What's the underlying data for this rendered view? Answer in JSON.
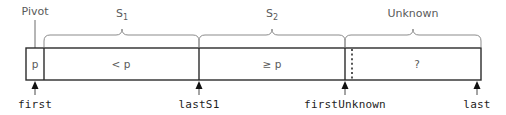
{
  "figure": {
    "width": 506,
    "height": 115,
    "background_color": "#ffffff",
    "line_color": "#2b2b2b",
    "brace_color": "#8b8b8b",
    "label_color": "#5a5a5a",
    "index_color": "#1d1d1d"
  },
  "annotations": {
    "pivot": {
      "label": "Pivot",
      "points_to": "pivot-cell"
    }
  },
  "braces": [
    {
      "name": "s1",
      "label": "S",
      "subscript": "1",
      "x_start": 44,
      "x_end": 199,
      "center": 122
    },
    {
      "name": "s2",
      "label": "S",
      "subscript": "2",
      "x_start": 199,
      "x_end": 345,
      "center": 272
    },
    {
      "name": "unknown",
      "label": "Unknown",
      "subscript": "",
      "x_start": 345,
      "x_end": 481,
      "center": 413
    }
  ],
  "bar": {
    "x": 26,
    "y": 48,
    "width": 455,
    "height": 32,
    "cells": [
      {
        "name": "pivot-cell",
        "label": "p",
        "x_start": 26,
        "x_end": 44,
        "center": 35
      },
      {
        "name": "less-than-pivot-cell",
        "label": "< p",
        "x_start": 44,
        "x_end": 199,
        "center": 121
      },
      {
        "name": "greater-equal-pivot-cell",
        "label": "≥ p",
        "x_start": 199,
        "x_end": 345,
        "center": 272
      },
      {
        "name": "unknown-cell",
        "label": "?",
        "x_start": 352,
        "x_end": 481,
        "center": 417
      }
    ],
    "dotted_divider_x": 352
  },
  "index_labels": [
    {
      "name": "first",
      "label": "first",
      "x": 35
    },
    {
      "name": "lastS1",
      "label": "lastS1",
      "x": 199
    },
    {
      "name": "firstUnknown",
      "label": "firstUnknown",
      "x": 345
    },
    {
      "name": "last",
      "label": "last",
      "x": 477
    }
  ]
}
